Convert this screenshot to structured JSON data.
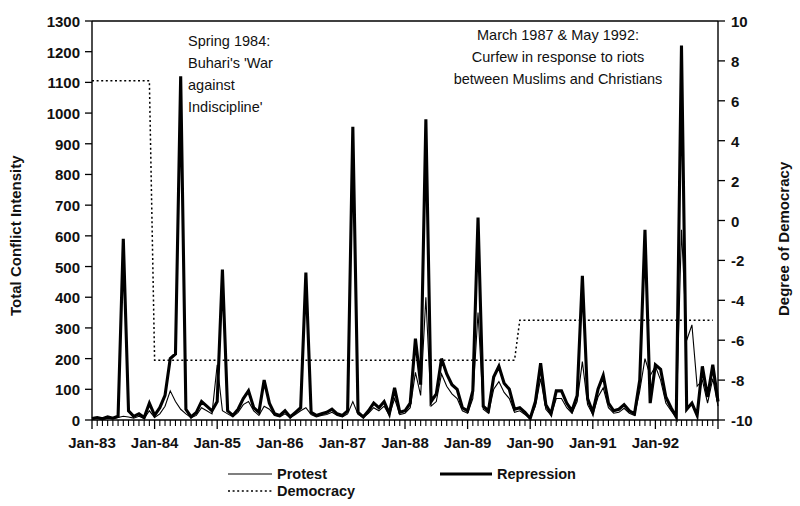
{
  "chart_data": {
    "type": "line",
    "title": "",
    "xlabel": "",
    "ylabel": "Total Conflict Intensity",
    "y2label": "Degree of Democracy",
    "ylim": [
      0,
      1300
    ],
    "y2lim": [
      -10,
      10
    ],
    "grid": false,
    "legend_position": "bottom",
    "ytick_labels": [
      "1300",
      "1200",
      "1100",
      "1000",
      "900",
      "800",
      "700",
      "600",
      "500",
      "400",
      "300",
      "200",
      "100",
      "0"
    ],
    "ytick_values": [
      1300,
      1200,
      1100,
      1000,
      900,
      800,
      700,
      600,
      500,
      400,
      300,
      200,
      100,
      0
    ],
    "y2tick_labels": [
      "10",
      "8",
      "6",
      "4",
      "2",
      "0",
      "-2",
      "-4",
      "-6",
      "-8",
      "-10"
    ],
    "y2tick_values": [
      10,
      8,
      6,
      4,
      2,
      0,
      -2,
      -4,
      -6,
      -8,
      -10
    ],
    "xtick_labels": [
      "Jan-83",
      "Jan-84",
      "Jan-85",
      "Jan-86",
      "Jan-87",
      "Jan-88",
      "Jan-89",
      "Jan-90",
      "Jan-91",
      "Jan-92"
    ],
    "x_minor_ticks_per_interval": 12,
    "x_start": "Jan-83",
    "x_end": "Dec-92",
    "n_points": 120,
    "legend": [
      {
        "name": "Protest",
        "style": "thin-solid"
      },
      {
        "name": "Democracy",
        "style": "dotted"
      },
      {
        "name": "Repression",
        "style": "thick-solid"
      }
    ],
    "annotations": [
      {
        "id": "annotation-1984",
        "lines": [
          "Spring 1984:",
          "Buhari's 'War",
          "against",
          "Indiscipline'"
        ],
        "align": "left"
      },
      {
        "id": "annotation-1987-1992",
        "lines": [
          "March 1987 & May 1992:",
          "Curfew in response to riots",
          "between Muslims and Christians"
        ],
        "align": "center"
      }
    ],
    "series": [
      {
        "name": "Repression",
        "axis": "left",
        "values": [
          5,
          8,
          4,
          10,
          6,
          12,
          590,
          30,
          12,
          20,
          8,
          55,
          15,
          40,
          80,
          200,
          215,
          1120,
          35,
          10,
          25,
          60,
          45,
          30,
          60,
          490,
          30,
          15,
          35,
          70,
          95,
          40,
          25,
          130,
          55,
          20,
          15,
          30,
          10,
          25,
          40,
          480,
          25,
          15,
          20,
          25,
          35,
          20,
          15,
          30,
          955,
          25,
          10,
          30,
          55,
          40,
          60,
          20,
          105,
          25,
          30,
          55,
          265,
          115,
          980,
          60,
          85,
          200,
          150,
          115,
          100,
          40,
          30,
          95,
          660,
          45,
          30,
          140,
          175,
          120,
          100,
          35,
          40,
          25,
          5,
          60,
          185,
          50,
          20,
          95,
          95,
          55,
          30,
          80,
          470,
          70,
          25,
          100,
          145,
          55,
          30,
          35,
          50,
          30,
          20,
          130,
          620,
          55,
          180,
          165,
          75,
          40,
          10,
          1220,
          35,
          55,
          15,
          175,
          75,
          180,
          60
        ]
      },
      {
        "name": "Protest",
        "axis": "left",
        "values": [
          3,
          5,
          3,
          6,
          4,
          8,
          12,
          10,
          6,
          12,
          5,
          30,
          8,
          20,
          45,
          95,
          60,
          35,
          20,
          8,
          15,
          40,
          30,
          20,
          180,
          30,
          20,
          10,
          25,
          50,
          60,
          30,
          15,
          45,
          35,
          15,
          10,
          20,
          8,
          18,
          30,
          40,
          18,
          10,
          15,
          18,
          25,
          15,
          10,
          20,
          60,
          18,
          8,
          22,
          40,
          30,
          45,
          15,
          70,
          18,
          22,
          40,
          155,
          80,
          400,
          45,
          60,
          150,
          110,
          85,
          70,
          30,
          22,
          70,
          350,
          35,
          22,
          100,
          125,
          90,
          70,
          25,
          30,
          18,
          4,
          45,
          135,
          35,
          15,
          70,
          70,
          40,
          22,
          60,
          190,
          50,
          18,
          75,
          105,
          40,
          22,
          25,
          38,
          22,
          15,
          95,
          200,
          145,
          175,
          130,
          55,
          30,
          8,
          620,
          260,
          310,
          110,
          130,
          55,
          135,
          45
        ]
      },
      {
        "name": "Democracy",
        "axis": "right",
        "display_levels_left_axis": [
          1100,
          190,
          330
        ],
        "description": "Democracy score plotted on right axis: high (~+7) until Dec-1983, drops to (~-7) through 1989, rises to (~-5) from 1989 onward",
        "values": [
          7,
          7,
          7,
          7,
          7,
          7,
          7,
          7,
          7,
          7,
          7,
          7,
          -7,
          -7,
          -7,
          -7,
          -7,
          -7,
          -7,
          -7,
          -7,
          -7,
          -7,
          -7,
          -7,
          -7,
          -7,
          -7,
          -7,
          -7,
          -7,
          -7,
          -7,
          -7,
          -7,
          -7,
          -7,
          -7,
          -7,
          -7,
          -7,
          -7,
          -7,
          -7,
          -7,
          -7,
          -7,
          -7,
          -7,
          -7,
          -7,
          -7,
          -7,
          -7,
          -7,
          -7,
          -7,
          -7,
          -7,
          -7,
          -7,
          -7,
          -7,
          -7,
          -7,
          -7,
          -7,
          -7,
          -7,
          -7,
          -7,
          -7,
          -7,
          -7,
          -7,
          -7,
          -7,
          -7,
          -7,
          -7,
          -7,
          -7,
          -5,
          -5,
          -5,
          -5,
          -5,
          -5,
          -5,
          -5,
          -5,
          -5,
          -5,
          -5,
          -5,
          -5,
          -5,
          -5,
          -5,
          -5,
          -5,
          -5,
          -5,
          -5,
          -5,
          -5,
          -5,
          -5,
          -5,
          -5,
          -5,
          -5,
          -5,
          -5,
          -5,
          -5,
          -5,
          -5,
          -5,
          -5
        ]
      }
    ]
  }
}
